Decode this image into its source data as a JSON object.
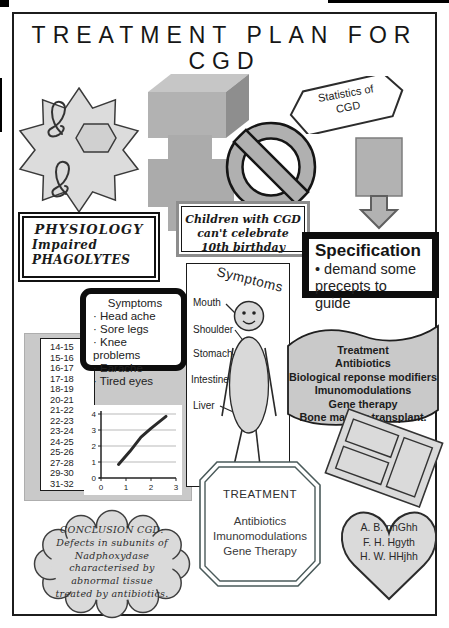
{
  "title": {
    "line1": "TREATMENT PLAN FOR",
    "line2": "CGD"
  },
  "statistics_banner": {
    "line1": "Statistics of",
    "line2": "CGD"
  },
  "physiology_box": {
    "title": "PHYSIOLOGY",
    "lines": [
      "Impaired",
      "PHAGOLYTES"
    ]
  },
  "children_box": {
    "line1": "Children with CGD",
    "line2": "can't celebrate 10th birthday"
  },
  "specification_box": {
    "title": "Specification",
    "bullet": "• demand some precepts to guide"
  },
  "symptoms_box": {
    "title": "Symptoms",
    "items": [
      "Head ache",
      "Sore legs",
      "Knee problems",
      "Earache",
      "Tired eyes"
    ]
  },
  "age_list": {
    "items": [
      "14-15",
      "15-16",
      "16-17",
      "17-18",
      "18-19",
      "20-21",
      "21-22",
      "22-23",
      "23-24",
      "24-25",
      "25-26",
      "27-28",
      "29-30",
      "31-32"
    ]
  },
  "figure_panel": {
    "title": "Symptoms",
    "labels": {
      "mouth": "Mouth",
      "shoulder": "Shoulder",
      "stomach": "Stomach",
      "intestine": "Intestine",
      "liver": "Liver"
    }
  },
  "treatment_wave": {
    "lines": [
      "Treatment",
      "Antibiotics",
      "Biological reponse modifiers",
      "Imunomodulations",
      "Gene therapy",
      "Bone marrow transplant."
    ]
  },
  "treatment_box": {
    "title": "TREATMENT",
    "items": [
      "Antibiotics",
      "Imunomodulations",
      "Gene Therapy"
    ]
  },
  "conclusion_cloud": {
    "lines": [
      "CONCLUSION CGD:",
      "Defects in subunits of",
      "Nadphoxydase",
      "characterised by",
      "abnormal tissue",
      "treated by antibiotics."
    ]
  },
  "heart": {
    "names": [
      "A. B. nhGhh",
      "F. H. Hgyth",
      "H. W. HHjhh"
    ]
  },
  "colors": {
    "shape_light_gray": "#d9d9d9",
    "shape_mid_gray": "#b0b0b0",
    "panel_gray": "#c9c9c9",
    "border_black": "#111111"
  },
  "chart_data": {
    "type": "line",
    "title": "",
    "xlabel": "",
    "ylabel": "",
    "x": [
      0.7,
      1.15,
      1.6,
      2.0,
      2.6
    ],
    "y": [
      0.85,
      1.65,
      2.55,
      3.1,
      3.85
    ],
    "xlim": [
      0,
      3
    ],
    "ylim": [
      0,
      4
    ],
    "xticks": [
      0,
      1,
      2,
      3
    ],
    "yticks": [
      0,
      1,
      2,
      3,
      4
    ],
    "grid": "horizontal",
    "legend": false
  }
}
